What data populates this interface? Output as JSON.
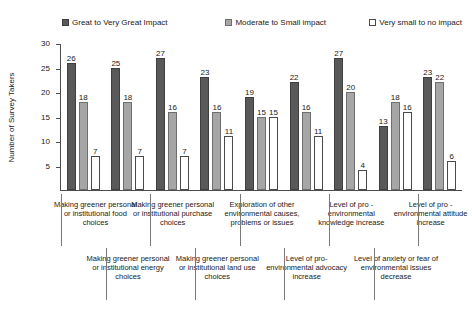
{
  "chart_data": {
    "type": "bar",
    "title": "",
    "xlabel": "",
    "ylabel": "Number of Survey Takers",
    "ylim": [
      0,
      30
    ],
    "yticks": [
      30,
      25,
      20,
      15,
      10,
      5
    ],
    "grid": false,
    "legend_position": "top",
    "categories": [
      "Making greener personal or institutional food choices",
      "Making greener personal or institutional energy choices",
      "Making greener personal or institutional purchase choices",
      "Making greener personal or institutional land use choices",
      "Exploration of other environmental causes, problems or issues",
      "Level of pro-environmental advocacy increase",
      "Level of pro - environmental knowledge increase",
      "Level of anxiety or fear of environmental issues decrease",
      "Level of pro - environmental attitude increase"
    ],
    "series": [
      {
        "name": "Great to Very Great Impact",
        "color": "#595959",
        "values": [
          26,
          25,
          27,
          23,
          19,
          22,
          27,
          13,
          23
        ]
      },
      {
        "name": "Moderate to Small impact",
        "color": "#a6a6a6",
        "values": [
          18,
          18,
          16,
          16,
          15,
          16,
          20,
          18,
          22
        ]
      },
      {
        "name": "Very small to no impact",
        "color": "#ffffff",
        "values": [
          7,
          7,
          7,
          11,
          15,
          11,
          4,
          16,
          6
        ]
      }
    ]
  },
  "legend": {
    "items": [
      {
        "label": "Great to Very Great Impact"
      },
      {
        "label": "Moderate to Small impact"
      },
      {
        "label": "Very small to no impact"
      }
    ]
  },
  "axis": {
    "y_title": "Number of Survey Takers",
    "y_tick_labels": [
      "30",
      "25",
      "20",
      "15",
      "10",
      "5"
    ]
  }
}
